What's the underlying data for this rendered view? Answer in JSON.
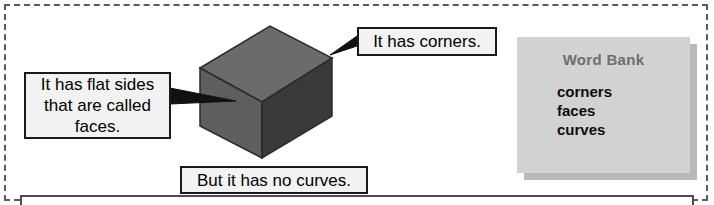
{
  "worksheet": {
    "frame_color": "#5a5a5a",
    "background": "#ffffff"
  },
  "shape": {
    "name": "cube-illustration",
    "top_face_color": "#6b6b6b",
    "left_face_color": "#5e5e5e",
    "right_face_color": "#3a3a3a",
    "outline_color": "#2b2b2b"
  },
  "callouts": [
    {
      "id": "faces",
      "text": "It has flat sides\nthat are called\nfaces.",
      "box_color": "#f2f2f2",
      "border_color": "#1a1a1a"
    },
    {
      "id": "corners",
      "text": "It has corners.",
      "box_color": "#f2f2f2",
      "border_color": "#1a1a1a"
    },
    {
      "id": "curves",
      "text": "But it has no curves.",
      "box_color": "#f2f2f2",
      "border_color": "#1a1a1a"
    }
  ],
  "word_bank": {
    "title": "Word Bank",
    "title_color": "#6e6e6e",
    "panel_color": "#d2d2d2",
    "shadow_color": "#b9b9b9",
    "words": [
      "corners",
      "faces",
      "curves"
    ]
  },
  "bottom_panel": {
    "border_color": "#4d4d4d"
  }
}
